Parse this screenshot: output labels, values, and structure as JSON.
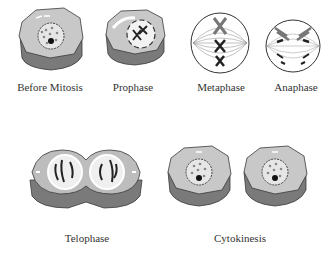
{
  "diagram": {
    "stages": [
      {
        "id": "before-mitosis",
        "label": "Before Mitosis"
      },
      {
        "id": "prophase",
        "label": "Prophase"
      },
      {
        "id": "metaphase",
        "label": "Metaphase"
      },
      {
        "id": "anaphase",
        "label": "Anaphase"
      },
      {
        "id": "telophase",
        "label": "Telophase"
      },
      {
        "id": "cytokinesis",
        "label": "Cytokinesis"
      }
    ],
    "colors": {
      "cell_top": "#c8c8c8",
      "cell_side": "#7a7a7a",
      "outline": "#3a3a3a",
      "chromosome": "#2a2a2a",
      "background": "#ffffff"
    }
  }
}
